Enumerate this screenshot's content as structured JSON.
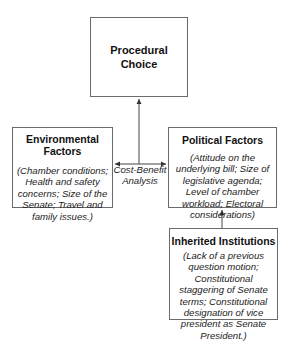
{
  "diagram": {
    "nodes": {
      "procedural_choice": {
        "title": "Procedural Choice",
        "title_lines": [
          "Procedural",
          "Choice"
        ]
      },
      "environmental": {
        "title": "Environmental Factors",
        "body": "(Chamber conditions; Health and safety concerns; Size of the Senate; Travel and family issues.)"
      },
      "political": {
        "title": "Political Factors",
        "body": "(Attitude on the underlying bill; Size of legislative agenda; Level of chamber workload; Electoral considerations)"
      },
      "inherited": {
        "title": "Inherited Institutions",
        "body": "(Lack of a previous question motion; Constitutional staggering of Senate terms; Constitutional designation of vice president as Senate President.)"
      }
    },
    "connector_label": {
      "line1": "Cost-Benefit",
      "line2": "Analysis"
    },
    "edges": [
      {
        "from": "cost-benefit-analysis",
        "to": "procedural_choice",
        "type": "arrow"
      },
      {
        "from": "cost-benefit-analysis",
        "to": "environmental",
        "type": "arrow"
      },
      {
        "from": "cost-benefit-analysis",
        "to": "political",
        "type": "arrow"
      },
      {
        "from": "inherited",
        "to": "political",
        "type": "arrow"
      }
    ],
    "colors": {
      "border": "#6b6b6b",
      "line": "#444444",
      "text": "#111111",
      "background": "#ffffff"
    }
  }
}
